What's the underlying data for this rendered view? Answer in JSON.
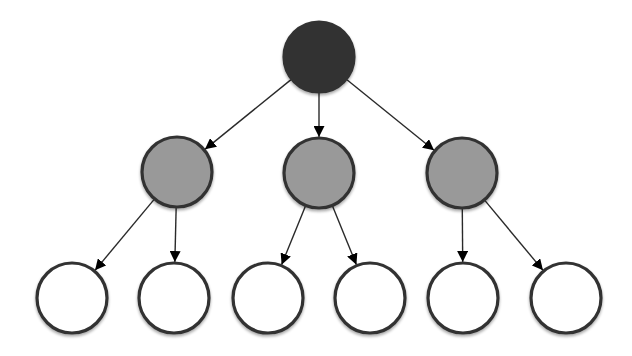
{
  "diagram": {
    "type": "tree",
    "colors": {
      "root_fill": "#333333",
      "internal_fill": "#999999",
      "leaf_fill": "#ffffff",
      "stroke": "#333333",
      "edge": "#2a2a2a",
      "arrowhead": "#000000"
    },
    "nodes": [
      {
        "id": "root",
        "level": 0,
        "kind": "root"
      },
      {
        "id": "child-1",
        "level": 1,
        "kind": "internal",
        "parent": "root"
      },
      {
        "id": "child-2",
        "level": 1,
        "kind": "internal",
        "parent": "root"
      },
      {
        "id": "child-3",
        "level": 1,
        "kind": "internal",
        "parent": "root"
      },
      {
        "id": "leaf-1",
        "level": 2,
        "kind": "leaf",
        "parent": "child-1"
      },
      {
        "id": "leaf-2",
        "level": 2,
        "kind": "leaf",
        "parent": "child-1"
      },
      {
        "id": "leaf-3",
        "level": 2,
        "kind": "leaf",
        "parent": "child-2"
      },
      {
        "id": "leaf-4",
        "level": 2,
        "kind": "leaf",
        "parent": "child-2"
      },
      {
        "id": "leaf-5",
        "level": 2,
        "kind": "leaf",
        "parent": "child-3"
      },
      {
        "id": "leaf-6",
        "level": 2,
        "kind": "leaf",
        "parent": "child-3"
      }
    ],
    "edges": [
      {
        "from": "root",
        "to": "child-1"
      },
      {
        "from": "root",
        "to": "child-2"
      },
      {
        "from": "root",
        "to": "child-3"
      },
      {
        "from": "child-1",
        "to": "leaf-1"
      },
      {
        "from": "child-1",
        "to": "leaf-2"
      },
      {
        "from": "child-2",
        "to": "leaf-3"
      },
      {
        "from": "child-2",
        "to": "leaf-4"
      },
      {
        "from": "child-3",
        "to": "leaf-5"
      },
      {
        "from": "child-3",
        "to": "leaf-6"
      }
    ]
  }
}
